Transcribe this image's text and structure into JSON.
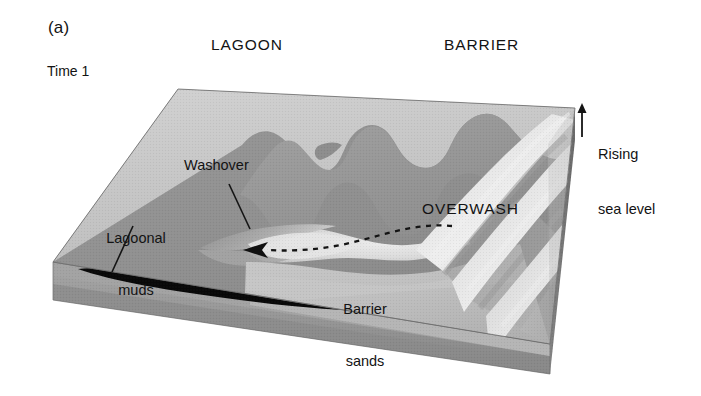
{
  "figure": {
    "panel_letter": "(a)",
    "time_label": "Time 1",
    "headers": {
      "lagoon": "LAGOON",
      "barrier": "BARRIER"
    },
    "labels": {
      "washover": "Washover",
      "lagoonal_muds_line1": "Lagoonal",
      "lagoonal_muds_line2": "muds",
      "barrier_sands_line1": "Barrier",
      "barrier_sands_line2": "sands",
      "overwash": "OVERWASH",
      "rising_line1": "Rising",
      "rising_line2": "sea level"
    },
    "colors": {
      "lagoon_floor": "#8e8e8e",
      "lagoon_shallow": "#c9c9c9",
      "barrier_backslope": "#9b9b9b",
      "barrier_crest_light": "#d8d8d8",
      "dune_highlight": "#e6e6e6",
      "front_face": "#9a9a9a",
      "front_face_lower": "#8a8a8a",
      "side_face": "#707070",
      "sand_wedge": "#c2c2c2",
      "mud_lens": "#080808",
      "washover_fan": "#dcdcdc",
      "line": "#141414",
      "background": "#ffffff"
    },
    "annotations": {
      "sea_level_arrow": "up-arrow",
      "overwash_flow_arrow": "dashed-arrow-pointing-left"
    }
  }
}
